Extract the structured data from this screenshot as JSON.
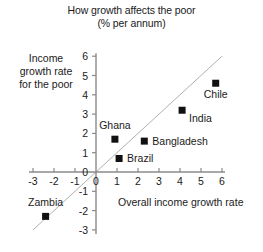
{
  "chart_data": {
    "type": "scatter",
    "title": "How growth affects the poor",
    "subtitle": "(% per annum)",
    "xlabel": "Overall income growth rate",
    "ylabel": "Income growth rate for the poor",
    "ylabel_lines": [
      "Income",
      "growth rate",
      "for the poor"
    ],
    "xlim": [
      -3,
      6
    ],
    "ylim": [
      -3,
      6
    ],
    "xticks": [
      -3,
      -2,
      -1,
      0,
      1,
      2,
      3,
      4,
      5,
      6
    ],
    "yticks": [
      -3,
      -2,
      -1,
      0,
      1,
      2,
      3,
      4,
      5,
      6
    ],
    "xtick_labels": [
      "-3",
      "-2",
      "-1",
      "0",
      "1",
      "2",
      "3",
      "4",
      "5",
      "6"
    ],
    "ytick_labels": [
      "-3",
      "-2",
      "-1",
      "0",
      "1",
      "2",
      "3",
      "4",
      "5",
      "6"
    ],
    "grid": false,
    "legend": "none",
    "reference_line": {
      "name": "45-degree line",
      "slope": 1,
      "intercept": 0,
      "style": "thin solid grey"
    },
    "marker": {
      "shape": "square",
      "color": "#111111",
      "size": 7
    },
    "points": [
      {
        "name": "Zambia",
        "x": -2.4,
        "y": -2.3,
        "label_dx": 0,
        "label_dy": -10,
        "label_anchor": "middle"
      },
      {
        "name": "Brazil",
        "x": 1.1,
        "y": 0.7,
        "label_dx": 8,
        "label_dy": 4,
        "label_anchor": "start"
      },
      {
        "name": "Ghana",
        "x": 0.9,
        "y": 1.7,
        "label_dx": 0,
        "label_dy": -10,
        "label_anchor": "middle"
      },
      {
        "name": "Bangladesh",
        "x": 2.3,
        "y": 1.6,
        "label_dx": 8,
        "label_dy": 4,
        "label_anchor": "start"
      },
      {
        "name": "India",
        "x": 4.1,
        "y": 3.2,
        "label_dx": 7,
        "label_dy": 12,
        "label_anchor": "start"
      },
      {
        "name": "Chile",
        "x": 5.7,
        "y": 4.6,
        "label_dx": 0,
        "label_dy": 15,
        "label_anchor": "middle"
      }
    ]
  }
}
